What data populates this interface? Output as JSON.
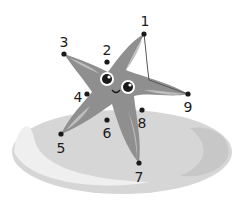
{
  "worksheet": {
    "subject": "starfish-on-rock",
    "colors": {
      "rock": "#d3d3d3",
      "rock_shadow": "#c4c4c4",
      "rock_highlight": "#f4f4f4",
      "starfish_body": "#8f8f8f",
      "starfish_light": "#bdbdbd",
      "dot": "#1a1a1a",
      "line": "#555555"
    },
    "dots": [
      {
        "label": "1",
        "x": 144,
        "y": 34,
        "lx": 145,
        "ly": 26
      },
      {
        "label": "2",
        "x": 107,
        "y": 62,
        "lx": 107,
        "ly": 55
      },
      {
        "label": "3",
        "x": 64,
        "y": 54,
        "lx": 64,
        "ly": 47
      },
      {
        "label": "4",
        "x": 87,
        "y": 94,
        "lx": 78,
        "ly": 102
      },
      {
        "label": "5",
        "x": 61,
        "y": 134,
        "lx": 61,
        "ly": 153
      },
      {
        "label": "6",
        "x": 107,
        "y": 120,
        "lx": 107,
        "ly": 138
      },
      {
        "label": "7",
        "x": 139,
        "y": 163,
        "lx": 139,
        "ly": 182
      },
      {
        "label": "8",
        "x": 142,
        "y": 110,
        "lx": 142,
        "ly": 128
      },
      {
        "label": "9",
        "x": 188,
        "y": 94,
        "lx": 188,
        "ly": 112
      }
    ],
    "connected_line": {
      "from": "1",
      "to": "9"
    }
  }
}
